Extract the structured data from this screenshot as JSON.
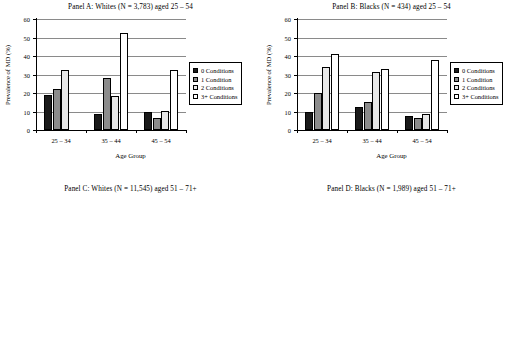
{
  "figure": {
    "axis_x_title": "Age Group",
    "axis_y_title_ab": "Prevalence of MD (%)",
    "axis_y_title_cd": "Prevalence of MD(%)"
  },
  "legend": {
    "items": [
      {
        "label": "0 Conditions",
        "color": "#1a1a1a"
      },
      {
        "label": "1 Condition",
        "color": "#8c8c8c"
      },
      {
        "label": "2 Conditions",
        "color": "#e8e8e8"
      },
      {
        "label": "3+ Conditions",
        "color": "#ffffff"
      }
    ]
  },
  "chart_data": [
    {
      "id": "panel-a",
      "type": "bar",
      "title": "Panel A: Whites (N = 3,783) aged 25 – 54",
      "xlabel": "Age Group",
      "ylabel": "Prevalence of MD (%)",
      "ylim": [
        0,
        60
      ],
      "yticks": [
        0,
        10,
        20,
        30,
        40,
        50,
        60
      ],
      "grid": true,
      "legend_position": "right",
      "categories": [
        "25 – 34",
        "35 – 44",
        "45 – 54"
      ],
      "series": [
        {
          "name": "0 Conditions",
          "values": [
            19.0,
            8.5,
            10.0
          ]
        },
        {
          "name": "1 Condition",
          "values": [
            22.0,
            28.0,
            6.5
          ]
        },
        {
          "name": "2 Conditions",
          "values": [
            32.5,
            18.5,
            10.5
          ]
        },
        {
          "name": "3+ Conditions",
          "values": [
            0,
            52.5,
            32.5
          ]
        }
      ]
    },
    {
      "id": "panel-b",
      "type": "bar",
      "title": "Panel B: Blacks (N = 434) aged 25 – 54",
      "xlabel": "Age Group",
      "ylabel": "Prevalence of MD (%)",
      "ylim": [
        0,
        60
      ],
      "yticks": [
        0,
        10,
        20,
        30,
        40,
        50,
        60
      ],
      "grid": true,
      "legend_position": "right",
      "categories": [
        "25 – 34",
        "35 – 44",
        "45 – 54"
      ],
      "series": [
        {
          "name": "0 Conditions",
          "values": [
            9.8,
            12.3,
            7.6
          ]
        },
        {
          "name": "1 Condition",
          "values": [
            20.0,
            15.2,
            6.6
          ]
        },
        {
          "name": "2 Conditions",
          "values": [
            34.2,
            31.3,
            8.6
          ]
        },
        {
          "name": "3+ Conditions",
          "values": [
            41.3,
            33.0,
            38.0
          ]
        }
      ]
    },
    {
      "id": "panel-c",
      "type": "bar",
      "title": "Panel C: Whites (N = 11,545) aged 51 – 71+",
      "xlabel": "Age Group",
      "ylabel": "Prevalence of MD(%)",
      "ylim": [
        0,
        30
      ],
      "yticks": [
        0,
        5,
        10,
        15,
        20,
        25,
        30
      ],
      "grid": true,
      "legend_position": "right",
      "categories": [
        "51 – 60",
        "61 – 70",
        "71+"
      ],
      "series": [
        {
          "name": "0 Conditions",
          "values": [
            2.8,
            4.4,
            3.0
          ]
        },
        {
          "name": "1 Condition",
          "values": [
            6.0,
            2.2,
            3.0
          ]
        },
        {
          "name": "2 Conditions",
          "values": [
            6.6,
            3.3,
            3.3
          ]
        },
        {
          "name": "3+ Conditions",
          "values": [
            29.8,
            10.0,
            5.2
          ]
        }
      ]
    },
    {
      "id": "panel-d",
      "type": "bar",
      "title": "Panel D: Blacks (N = 1,989) aged 51 – 71+",
      "xlabel": "Age Group",
      "ylabel": "Prevalence of MD(%)",
      "ylim": [
        0,
        30
      ],
      "yticks": [
        0,
        5,
        10,
        15,
        20,
        25,
        30
      ],
      "grid": true,
      "legend_position": "right",
      "categories": [
        "51 – 60",
        "61 – 70",
        "71+"
      ],
      "series": [
        {
          "name": "0 Conditions",
          "values": [
            5.8,
            3.6,
            2.3
          ]
        },
        {
          "name": "1 Condition",
          "values": [
            11.4,
            4.4,
            3.8
          ]
        },
        {
          "name": "2 Conditions",
          "values": [
            13.0,
            12.4,
            5.5
          ]
        },
        {
          "name": "3+ Conditions",
          "values": [
            27.5,
            14.3,
            8.3
          ]
        }
      ]
    }
  ]
}
